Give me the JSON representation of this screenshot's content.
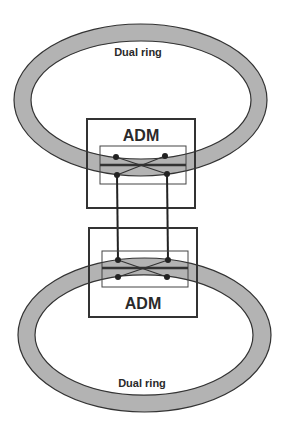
{
  "diagram": {
    "colors": {
      "ring_fill": "#b3b3b3",
      "stroke": "#333333",
      "background": "#ffffff"
    },
    "rings": [
      {
        "id": "top-ring",
        "label": "Dual ring"
      },
      {
        "id": "bottom-ring",
        "label": "Dual ring"
      }
    ],
    "nodes": [
      {
        "id": "top-adm",
        "label": "ADM"
      },
      {
        "id": "bottom-adm",
        "label": "ADM"
      }
    ],
    "links": [
      {
        "from": "top-adm",
        "to": "bottom-adm",
        "type": "interconnect"
      },
      {
        "from": "top-adm",
        "to": "bottom-adm",
        "type": "interconnect"
      }
    ]
  }
}
